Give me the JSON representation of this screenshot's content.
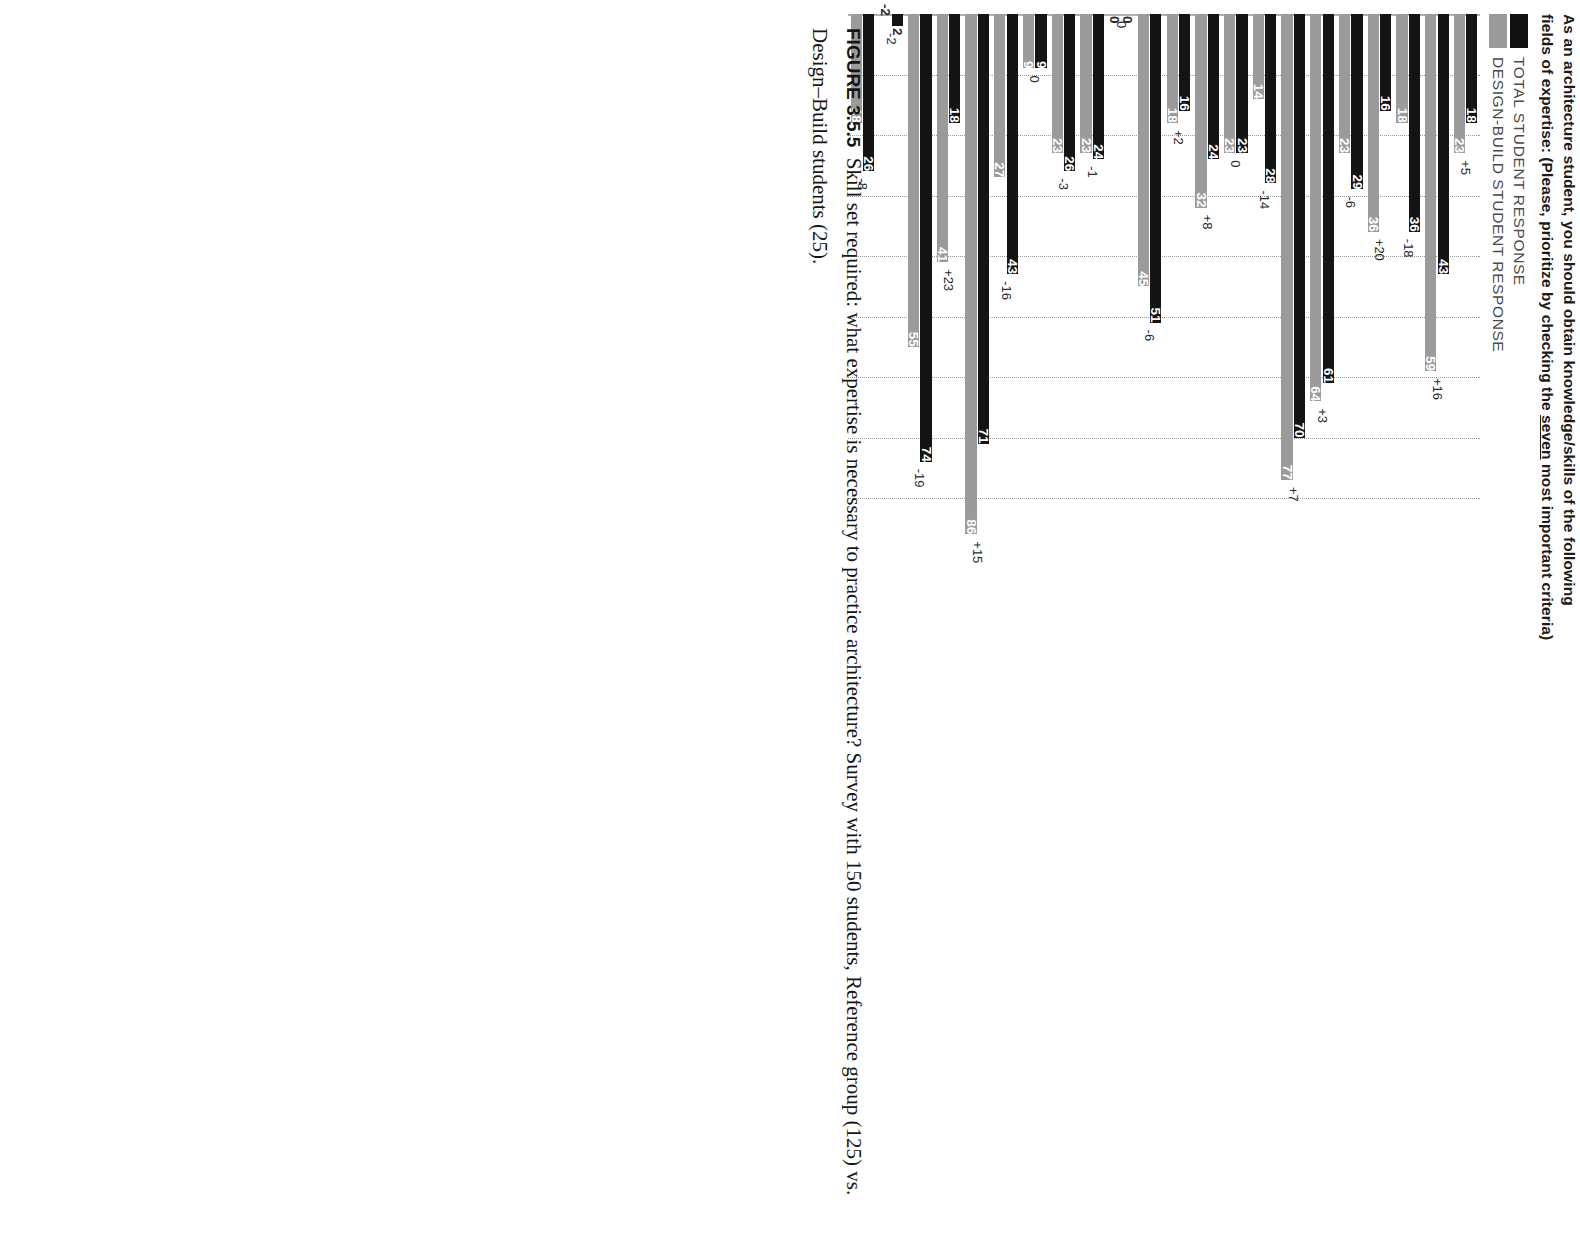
{
  "title": {
    "line1_a": "As an architecture student, you should obtain knowledge/skills of the following",
    "line2_a": "fields of expertise: (Please, prioritize by checking the ",
    "line2_u": "seven",
    "line2_b": " most important criteria)"
  },
  "legend": [
    {
      "label": "TOTAL STUDENT RESPONSE",
      "color": "#141414",
      "key": "total"
    },
    {
      "label": "DESIGN-BUILD STUDENT RESPONSE",
      "color": "#9b9b9b",
      "key": "designbuild"
    }
  ],
  "caption": {
    "figure_number": "FIGURE 3.5.5",
    "text": "Skill set required: what expertise is necessary to practice architecture? Survey with 150 students, Reference group (125) vs. Design–Build students (25)."
  },
  "chart_data": {
    "type": "bar",
    "orientation": "horizontal",
    "title": "As an architecture student, you should obtain knowledge/skills of the following fields of expertise: (Please, prioritize by checking the seven most important criteria)",
    "xlabel": "",
    "ylabel": "",
    "xlim": [
      0,
      100
    ],
    "grid": true,
    "gridlines": [
      10,
      20,
      30,
      40,
      50,
      60,
      70,
      80
    ],
    "legend_position": "top-left",
    "categories": [
      "1) Literacy in rules of aesthetics",
      "2) Construction methods + related appearances",
      "3) Digital Rendering/ animations",
      "4) Coordination among comprehensive factors",
      "5) Project management: time + budget planning",
      "6) Hand sketching/ hand drawing",
      "7) Technical computer drafting (CAD, BIM)",
      "8) Socializing skills +networking",
      "9) Writing and rhetoric skills",
      "10) Implementation of environmental factors",
      "11) Urban planning + infrastructure",
      "12) Structural knowledge",
      "13) Performance tracking + simulation",
      "14) Codes, regulations + policies",
      "15) Contemporary art + architecture",
      "16) Available materials, hardware, etc",
      "17) History of architecture",
      "18) Spatial thinking + form-making skills",
      "19) Buildability/ constructability",
      "20) Conceptual thinking",
      "21) Mechanical Engineering (MEP)",
      "22) Psychology + communication skills"
    ],
    "series": [
      {
        "name": "TOTAL STUDENT RESPONSE",
        "color": "#141414",
        "values": [
          18,
          43,
          36,
          16,
          29,
          61,
          70,
          28,
          23,
          24,
          16,
          51,
          0,
          24,
          26,
          9,
          43,
          71,
          18,
          74,
          2,
          26
        ]
      },
      {
        "name": "DESIGN-BUILD STUDENT RESPONSE",
        "color": "#9b9b9b",
        "values": [
          23,
          59,
          18,
          36,
          23,
          64,
          77,
          14,
          23,
          32,
          18,
          45,
          0,
          23,
          23,
          9,
          27,
          86,
          41,
          55,
          -2,
          18
        ]
      }
    ],
    "deltas": [
      "+5",
      "+16",
      "-18",
      "+20",
      "-6",
      "+3",
      "+7",
      "-14",
      "0",
      "+8",
      "+2",
      "-6",
      "0",
      "-1",
      "-3",
      "0",
      "-16",
      "+15",
      "+23",
      "-19",
      "-2",
      "-8"
    ]
  }
}
